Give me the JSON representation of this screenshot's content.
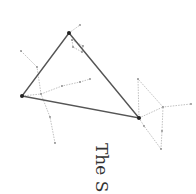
{
  "figure": {
    "caption": "The S",
    "colors": {
      "triangle": "#555555",
      "constellation": "#aaaaaa",
      "star": "#222222",
      "text": "#333333"
    }
  },
  "stars": {
    "main": [
      {
        "name": "top-star",
        "x": 69,
        "y": 33
      },
      {
        "name": "left-star",
        "x": 22,
        "y": 96
      },
      {
        "name": "right-star",
        "x": 139,
        "y": 118
      }
    ],
    "minor": [
      {
        "x": 80,
        "y": 25
      },
      {
        "x": 72,
        "y": 40
      },
      {
        "x": 83,
        "y": 46
      },
      {
        "x": 82,
        "y": 52
      },
      {
        "x": 73,
        "y": 47
      },
      {
        "x": 21,
        "y": 51
      },
      {
        "x": 37,
        "y": 67
      },
      {
        "x": 41,
        "y": 94
      },
      {
        "x": 62,
        "y": 86
      },
      {
        "x": 80,
        "y": 82
      },
      {
        "x": 90,
        "y": 79
      },
      {
        "x": 50,
        "y": 117
      },
      {
        "x": 55,
        "y": 143
      },
      {
        "x": 138,
        "y": 79
      },
      {
        "x": 163,
        "y": 107
      },
      {
        "x": 191,
        "y": 104
      },
      {
        "x": 144,
        "y": 126
      },
      {
        "x": 162,
        "y": 131
      },
      {
        "x": 161,
        "y": 149
      }
    ]
  }
}
